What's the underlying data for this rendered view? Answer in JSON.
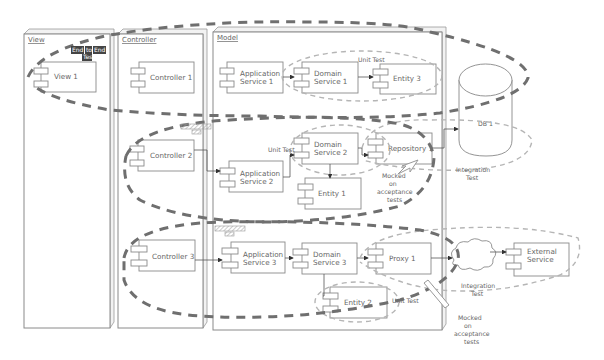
{
  "packages": {
    "view": {
      "title": "View"
    },
    "controller": {
      "title": "Controller"
    },
    "model": {
      "title": "Model"
    }
  },
  "components": {
    "view1": "View 1",
    "controller1": "Controller 1",
    "controller2": "Controller 2",
    "controller3": "Controller 3",
    "app_service1": [
      "Application",
      "Service 1"
    ],
    "app_service2": [
      "Application",
      "Service 2"
    ],
    "app_service3": [
      "Application",
      "Service 3"
    ],
    "domain_service1": [
      "Domain",
      "Service 1"
    ],
    "domain_service2": [
      "Domain",
      "Service 2"
    ],
    "domain_service3": [
      "Domain",
      "Service 3"
    ],
    "entity1": "Entity 1",
    "entity2": "Entity 2",
    "entity3": "Entity 3",
    "repository1": "Repository 1",
    "proxy1": "Proxy 1",
    "external_service": [
      "External",
      "Service"
    ],
    "db1": "DB 1"
  },
  "annotations": {
    "end_to_end": [
      "End",
      "to",
      "End",
      "Test"
    ],
    "unit_test_top": "Unit Test",
    "unit_test_mid": "Unit Test",
    "unit_test_bottom": "Unit Test",
    "integration_test_db": [
      "Integration",
      "Test"
    ],
    "integration_test_ext": [
      "Integration",
      "Test"
    ],
    "mocked_mid": [
      "Mocked",
      "on",
      "acceptance",
      "tests"
    ],
    "mocked_bottom": [
      "Mocked",
      "on",
      "acceptance",
      "tests"
    ]
  },
  "colors": {
    "big_dash": "#6f6f6f",
    "light_dash": "#b5b5b5",
    "outline": "#8a8a8a",
    "text": "#666666",
    "tag_bg": "#444444"
  }
}
